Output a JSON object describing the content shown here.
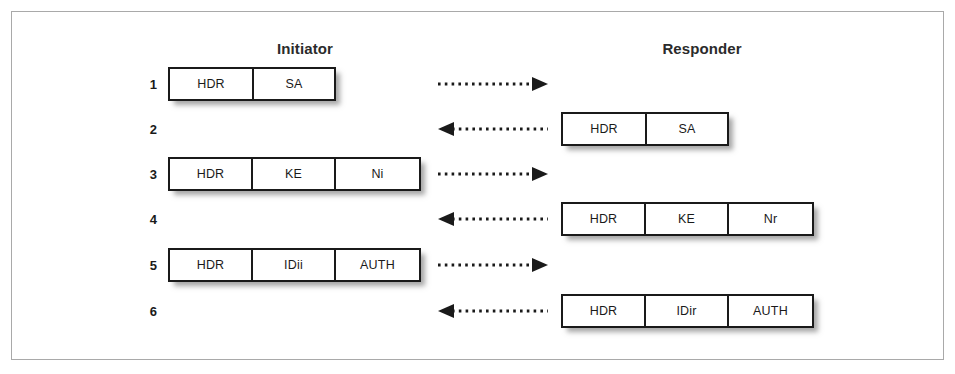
{
  "figure": {
    "title_initiator": "Initiator",
    "title_responder": "Responder",
    "accent_color": "#1a1a1a",
    "frame_color": "#a9a9a9",
    "background_color": "#ffffff"
  },
  "columns": {
    "initiator": {
      "label": "Initiator"
    },
    "responder": {
      "label": "Responder"
    }
  },
  "rows": [
    {
      "number": "1",
      "side": "initiator",
      "direction": "right",
      "cells": [
        "HDR",
        "SA"
      ]
    },
    {
      "number": "2",
      "side": "responder",
      "direction": "left",
      "cells": [
        "HDR",
        "SA"
      ]
    },
    {
      "number": "3",
      "side": "initiator",
      "direction": "right",
      "cells": [
        "HDR",
        "KE",
        "Ni"
      ]
    },
    {
      "number": "4",
      "side": "responder",
      "direction": "left",
      "cells": [
        "HDR",
        "KE",
        "Nr"
      ]
    },
    {
      "number": "5",
      "side": "initiator",
      "direction": "right",
      "cells": [
        "HDR",
        "IDii",
        "AUTH"
      ]
    },
    {
      "number": "6",
      "side": "responder",
      "direction": "left",
      "cells": [
        "HDR",
        "IDir",
        "AUTH"
      ]
    }
  ]
}
